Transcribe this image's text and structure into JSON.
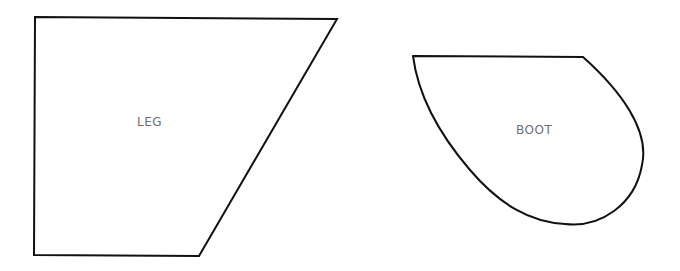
{
  "diagram": {
    "shapes": [
      {
        "id": "leg",
        "label": "LEG",
        "type": "trapezoid",
        "points": [
          [
            35,
            17
          ],
          [
            337,
            19
          ],
          [
            199,
            256
          ],
          [
            34,
            255
          ]
        ]
      },
      {
        "id": "boot",
        "label": "BOOT",
        "type": "teardrop",
        "path": "M 413 56 L 583 57 C 620 90 650 130 642 165 C 635 205 600 228 565 224 C 530 222 500 205 470 170 C 440 135 418 95 413 56 Z"
      }
    ],
    "stroke_color": "#111111",
    "label_color": "#6e6e6e"
  }
}
